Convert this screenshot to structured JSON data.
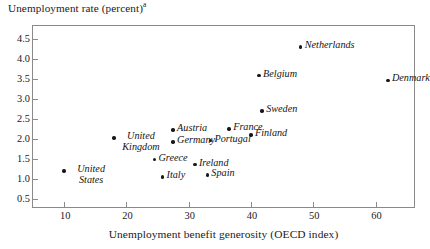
{
  "chart_data": {
    "type": "scatter",
    "title": "",
    "ylabel": "Unemployment rate (percent)",
    "ylabel_superscript": "a",
    "xlabel": "Unemployment benefit generosity (OECD index)",
    "xlim": [
      5,
      66.5
    ],
    "ylim": [
      0.25,
      4.82
    ],
    "xticks": [
      10,
      20,
      30,
      40,
      50,
      60
    ],
    "xtick_labels": [
      "10",
      "20",
      "30",
      "40",
      "50",
      "60"
    ],
    "yticks": [
      0.5,
      1.0,
      1.5,
      2.0,
      2.5,
      3.0,
      3.5,
      4.0,
      4.5
    ],
    "ytick_labels": [
      "0.5",
      "1.0",
      "1.5",
      "2.0",
      "2.5",
      "3.0",
      "3.5",
      "4.0",
      "4.5"
    ],
    "grid": false,
    "legend": false,
    "marker_color": "#191919",
    "frame_color": "#8a8a8a",
    "points": [
      {
        "label": "United States",
        "x": 10.0,
        "y": 1.2,
        "label_pos": "right-wrap"
      },
      {
        "label": "United Kingdom",
        "x": 18.0,
        "y": 2.02,
        "label_pos": "right-wrap"
      },
      {
        "label": "Greece",
        "x": 24.5,
        "y": 1.48,
        "label_pos": "right"
      },
      {
        "label": "Italy",
        "x": 25.8,
        "y": 1.05,
        "label_pos": "right"
      },
      {
        "label": "Austria",
        "x": 27.5,
        "y": 2.22,
        "label_pos": "right"
      },
      {
        "label": "Germany",
        "x": 27.5,
        "y": 1.92,
        "label_pos": "right"
      },
      {
        "label": "Ireland",
        "x": 31.0,
        "y": 1.36,
        "label_pos": "right"
      },
      {
        "label": "Spain",
        "x": 33.0,
        "y": 1.1,
        "label_pos": "right"
      },
      {
        "label": "Portugal",
        "x": 33.5,
        "y": 1.96,
        "label_pos": "right"
      },
      {
        "label": "France",
        "x": 36.5,
        "y": 2.25,
        "label_pos": "right"
      },
      {
        "label": "Finland",
        "x": 40.0,
        "y": 2.1,
        "label_pos": "right"
      },
      {
        "label": "Sweden",
        "x": 41.8,
        "y": 2.7,
        "label_pos": "right"
      },
      {
        "label": "Belgium",
        "x": 41.3,
        "y": 3.58,
        "label_pos": "right"
      },
      {
        "label": "Netherlands",
        "x": 48.0,
        "y": 4.3,
        "label_pos": "right"
      },
      {
        "label": "Denmark",
        "x": 62.0,
        "y": 3.46,
        "label_pos": "right"
      }
    ]
  }
}
